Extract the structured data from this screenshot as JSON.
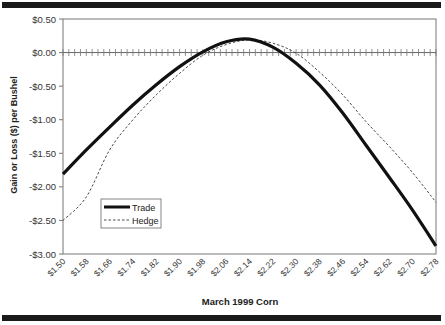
{
  "chart_data": {
    "type": "line",
    "title": "",
    "xlabel": "March 1999 Corn",
    "ylabel": "Gain or Loss ($) per Bushel",
    "ylim": [
      -3.0,
      0.5
    ],
    "yticks": [
      "$0.50",
      "$0.00",
      "-$0.50",
      "-$1.00",
      "-$1.50",
      "-$2.00",
      "-$2.50",
      "-$3.00"
    ],
    "categories": [
      "$1.50",
      "$1.58",
      "$1.66",
      "$1.74",
      "$1.82",
      "$1.90",
      "$1.98",
      "$2.06",
      "$2.14",
      "$2.22",
      "$2.30",
      "$2.38",
      "$2.46",
      "$2.54",
      "$2.62",
      "$2.70",
      "$2.78"
    ],
    "series": [
      {
        "name": "Trade",
        "style": "solid-thick",
        "color": "#111111",
        "values": [
          -1.81,
          -1.45,
          -1.11,
          -0.78,
          -0.48,
          -0.21,
          0.01,
          0.16,
          0.2,
          0.08,
          -0.16,
          -0.48,
          -0.9,
          -1.38,
          -1.86,
          -2.35,
          -2.88
        ]
      },
      {
        "name": "Hedge",
        "style": "dashed-thin",
        "color": "#333333",
        "values": [
          -2.5,
          -2.15,
          -1.45,
          -1.0,
          -0.63,
          -0.31,
          -0.04,
          0.12,
          0.19,
          0.14,
          -0.01,
          -0.29,
          -0.63,
          -1.03,
          -1.4,
          -1.79,
          -2.23
        ]
      }
    ],
    "legend": {
      "position": "lower-left-inside",
      "entries": [
        "Trade",
        "Hedge"
      ]
    },
    "grid": false,
    "zero_line": true
  },
  "legend": {
    "trade": "Trade",
    "hedge": "Hedge"
  },
  "axis": {
    "xtitle": "March 1999 Corn",
    "ytitle": "Gain or Loss ($) per Bushel"
  }
}
